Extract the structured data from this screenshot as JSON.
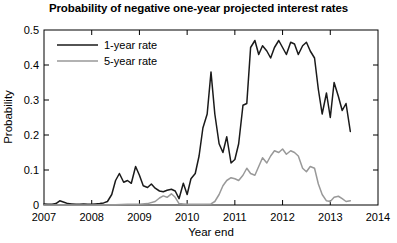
{
  "chart_data": {
    "type": "line",
    "title": "Probability of negative one-year projected interest rates",
    "xlabel": "Year end",
    "ylabel": "Probability",
    "xlim": [
      2007,
      2014
    ],
    "ylim": [
      0,
      0.5
    ],
    "xticks": [
      2007,
      2008,
      2009,
      2010,
      2011,
      2012,
      2013,
      2014
    ],
    "xticklabels": [
      "2007",
      "2008",
      "2009",
      "2010",
      "2011",
      "2012",
      "2013",
      "2014"
    ],
    "yticks": [
      0,
      0.1,
      0.2,
      0.3,
      0.4,
      0.5
    ],
    "yticklabels": [
      "0",
      "0.1",
      "0.2",
      "0.3",
      "0.4",
      "0.5"
    ],
    "grid": false,
    "legend_position": "upper left",
    "series": [
      {
        "name": "1-year rate",
        "color": "#1a1a1a",
        "x": [
          2007.0,
          2007.08,
          2007.17,
          2007.25,
          2007.33,
          2007.42,
          2007.5,
          2007.58,
          2007.67,
          2007.75,
          2007.83,
          2007.92,
          2008.0,
          2008.08,
          2008.17,
          2008.25,
          2008.33,
          2008.42,
          2008.5,
          2008.58,
          2008.67,
          2008.75,
          2008.83,
          2008.92,
          2009.0,
          2009.08,
          2009.17,
          2009.25,
          2009.33,
          2009.42,
          2009.5,
          2009.58,
          2009.67,
          2009.75,
          2009.83,
          2009.92,
          2010.0,
          2010.08,
          2010.17,
          2010.25,
          2010.33,
          2010.42,
          2010.5,
          2010.58,
          2010.67,
          2010.75,
          2010.83,
          2010.92,
          2011.0,
          2011.08,
          2011.17,
          2011.25,
          2011.33,
          2011.42,
          2011.5,
          2011.58,
          2011.67,
          2011.75,
          2011.83,
          2011.92,
          2012.0,
          2012.08,
          2012.17,
          2012.25,
          2012.33,
          2012.42,
          2012.5,
          2012.58,
          2012.67,
          2012.75,
          2012.83,
          2012.92,
          2013.0,
          2013.08,
          2013.17,
          2013.25,
          2013.33,
          2013.42
        ],
        "y": [
          0.003,
          0.002,
          0.002,
          0.004,
          0.012,
          0.008,
          0.004,
          0.003,
          0.002,
          0.002,
          0.003,
          0.002,
          0.002,
          0.003,
          0.004,
          0.006,
          0.01,
          0.03,
          0.07,
          0.09,
          0.065,
          0.07,
          0.062,
          0.11,
          0.085,
          0.055,
          0.05,
          0.06,
          0.048,
          0.04,
          0.038,
          0.042,
          0.045,
          0.04,
          0.018,
          0.062,
          0.03,
          0.075,
          0.09,
          0.14,
          0.22,
          0.26,
          0.38,
          0.26,
          0.175,
          0.15,
          0.195,
          0.12,
          0.13,
          0.175,
          0.285,
          0.29,
          0.45,
          0.47,
          0.43,
          0.455,
          0.44,
          0.42,
          0.45,
          0.47,
          0.45,
          0.43,
          0.465,
          0.46,
          0.43,
          0.455,
          0.465,
          0.44,
          0.42,
          0.33,
          0.26,
          0.32,
          0.25,
          0.35,
          0.31,
          0.27,
          0.29,
          0.21
        ]
      },
      {
        "name": "5-year rate",
        "color": "#999999",
        "x": [
          2007.0,
          2007.25,
          2007.5,
          2007.75,
          2008.0,
          2008.25,
          2008.5,
          2008.75,
          2009.0,
          2009.17,
          2009.33,
          2009.42,
          2009.5,
          2009.58,
          2009.67,
          2009.75,
          2009.83,
          2009.92,
          2010.0,
          2010.17,
          2010.33,
          2010.5,
          2010.58,
          2010.67,
          2010.75,
          2010.83,
          2010.92,
          2011.0,
          2011.08,
          2011.17,
          2011.25,
          2011.33,
          2011.42,
          2011.5,
          2011.58,
          2011.67,
          2011.75,
          2011.83,
          2011.92,
          2012.0,
          2012.08,
          2012.17,
          2012.25,
          2012.33,
          2012.42,
          2012.5,
          2012.58,
          2012.67,
          2012.75,
          2012.83,
          2012.92,
          2013.0,
          2013.08,
          2013.17,
          2013.25,
          2013.33,
          2013.42
        ],
        "y": [
          0.0,
          0.0,
          0.0,
          0.0,
          0.0,
          0.0,
          0.001,
          0.002,
          0.002,
          0.004,
          0.01,
          0.02,
          0.026,
          0.022,
          0.032,
          0.022,
          0.004,
          0.003,
          0.002,
          0.002,
          0.002,
          0.003,
          0.01,
          0.03,
          0.055,
          0.07,
          0.078,
          0.075,
          0.07,
          0.085,
          0.105,
          0.09,
          0.085,
          0.11,
          0.135,
          0.12,
          0.14,
          0.155,
          0.15,
          0.16,
          0.145,
          0.155,
          0.15,
          0.14,
          0.105,
          0.095,
          0.11,
          0.105,
          0.06,
          0.03,
          0.012,
          0.01,
          0.022,
          0.025,
          0.018,
          0.01,
          0.012
        ]
      }
    ]
  },
  "legend": {
    "items": [
      {
        "label": "1-year rate"
      },
      {
        "label": "5-year rate"
      }
    ]
  },
  "colors": {
    "series_1": "#1a1a1a",
    "series_2": "#999999",
    "axis": "#000000",
    "background": "#ffffff"
  }
}
